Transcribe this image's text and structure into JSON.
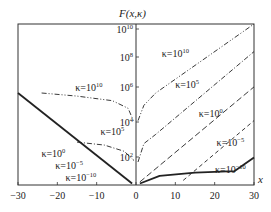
{
  "chart_data": {
    "type": "line",
    "title": "F(x,κ)",
    "xlabel": "x",
    "ylabel": "F(x,κ)",
    "y_scale": "log",
    "xlim": [
      -30,
      30
    ],
    "ylim_log10": [
      0,
      10.5
    ],
    "x_ticks": [
      -30,
      -20,
      -10,
      0,
      10,
      20,
      30
    ],
    "x_tick_labels": [
      "−30",
      "−20",
      "−10",
      "0",
      "10",
      "20",
      "30"
    ],
    "y_tick_labels": [
      {
        "base": "10",
        "exp": "10",
        "value_log10": 10
      },
      {
        "base": "10",
        "exp": "8",
        "value_log10": 8
      },
      {
        "base": "10",
        "exp": "6",
        "value_log10": 6
      },
      {
        "base": "10",
        "exp": "4",
        "value_log10": 4
      },
      {
        "base": "10",
        "exp": "2",
        "value_log10": 2
      }
    ],
    "grid": false,
    "legend": "inline labels",
    "series": [
      {
        "name": "κ=10^10",
        "style": "dash-dot-dot",
        "side": "both",
        "points_left": [
          [
            -24,
            6.0
          ],
          [
            -15,
            5.8
          ],
          [
            -6,
            5.5
          ],
          [
            -2,
            5.0
          ],
          [
            -0.5,
            4.1
          ]
        ],
        "points_right": [
          [
            0.5,
            4.2
          ],
          [
            2,
            5.2
          ],
          [
            5,
            6.0
          ],
          [
            30,
            10.8
          ]
        ]
      },
      {
        "name": "κ=10^5",
        "style": "dash-dot",
        "side": "both",
        "points_left": [
          [
            -15,
            2.8
          ],
          [
            -8,
            2.6
          ],
          [
            -3,
            2.2
          ],
          [
            -0.5,
            1.6
          ]
        ],
        "points_right": [
          [
            0.5,
            1.5
          ],
          [
            2,
            2.7
          ],
          [
            5,
            3.3
          ],
          [
            30,
            8.7
          ]
        ]
      },
      {
        "name": "κ=10^0",
        "style": "dashed",
        "side": "right",
        "points_right": [
          [
            1,
            0.2
          ],
          [
            30,
            6.4
          ]
        ]
      },
      {
        "name": "κ=10^-5",
        "style": "dashed-short",
        "side": "right",
        "points_right": [
          [
            12,
            0.3
          ],
          [
            30,
            4.2
          ]
        ]
      },
      {
        "name": "κ=10^-10",
        "style": "solid-thick",
        "side": "both",
        "points_left": [
          [
            -30,
            6.0
          ],
          [
            -1,
            0.1
          ]
        ],
        "points_right": [
          [
            1,
            0.1
          ],
          [
            6,
            0.6
          ],
          [
            15,
            0.8
          ],
          [
            25,
            0.9
          ],
          [
            30,
            1.8
          ]
        ]
      }
    ],
    "annotations": [
      {
        "text": "κ=10",
        "exp": "10",
        "x": -12,
        "y_px": 91
      },
      {
        "text": "κ=10",
        "exp": "5",
        "x": -6,
        "y_px": 135
      },
      {
        "text": "κ=10",
        "exp": "0",
        "x": -21,
        "y_px": 157
      },
      {
        "text": "κ=10",
        "exp": "−5",
        "x": -17,
        "y_px": 169
      },
      {
        "text": "κ=10",
        "exp": "−10",
        "x": -14,
        "y_px": 181
      },
      {
        "text": "κ=10",
        "exp": "10",
        "x": 10,
        "y_px": 57
      },
      {
        "text": "κ=10",
        "exp": "5",
        "x": 13,
        "y_px": 88
      },
      {
        "text": "κ=10",
        "exp": "0",
        "x": 19,
        "y_px": 117
      },
      {
        "text": "κ=10",
        "exp": "−5",
        "x": 24,
        "y_px": 146
      },
      {
        "text": "κ=10",
        "exp": "−10",
        "x": 24,
        "y_px": 173
      }
    ]
  },
  "labels": {
    "title": "F(x,κ)",
    "xaxis": "x"
  }
}
